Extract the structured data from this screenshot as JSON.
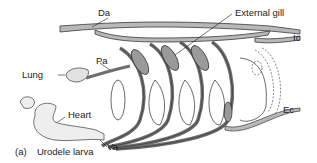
{
  "figure": {
    "caption_prefix": "(a)",
    "caption_title": "Urodele larva"
  },
  "labels": {
    "da": "Da",
    "external_gill": "External gill",
    "ic": "Ic",
    "lung": "Lung",
    "pa": "Pa",
    "heart": "Heart",
    "va": "Va",
    "ec": "Ec"
  },
  "colors": {
    "vessel_light": "#b8b8b8",
    "vessel_dark": "#6e6e6e",
    "outline": "#3a3a3a",
    "background": "#ffffff"
  }
}
